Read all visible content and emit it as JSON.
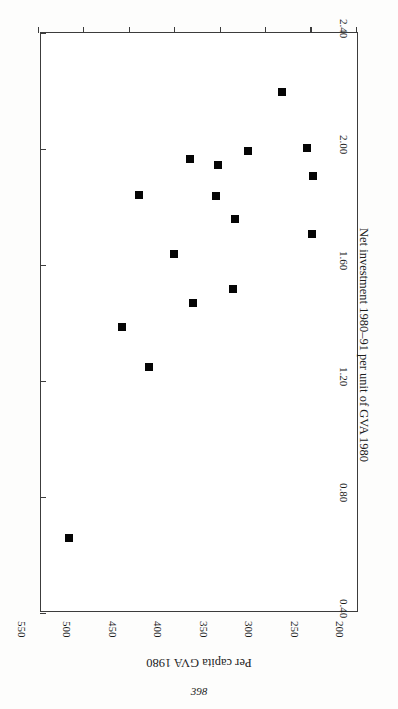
{
  "page": {
    "number": "398"
  },
  "chart_data": {
    "type": "scatter",
    "title": "",
    "subtitle": "",
    "xlabel": "Net investment 1980–91 per unit of GVA 1980",
    "ylabel": "Per capita GVA 1980",
    "xlim": [
      0.4,
      2.4
    ],
    "ylim": [
      200,
      550
    ],
    "xticks": [
      "0.40",
      "0.80",
      "1.20",
      "1.60",
      "2.00",
      "2.40"
    ],
    "xtick_values": [
      0.4,
      0.8,
      1.2,
      1.6,
      2.0,
      2.4
    ],
    "yticks": [
      "200",
      "250",
      "300",
      "350",
      "400",
      "450",
      "500",
      "550"
    ],
    "ytick_values": [
      200,
      250,
      300,
      350,
      400,
      450,
      500,
      550
    ],
    "grid": false,
    "legend": null,
    "legend_position": "none",
    "marker": "filled-square",
    "marker_color": "#050505",
    "frame_color": "#3c3c3c",
    "orientation_note": "figure printed rotated 90 degrees on the scanned page",
    "series": [
      {
        "name": "regions",
        "points": [
          {
            "x": 0.797,
            "y": 495
          },
          {
            "x": 0.893,
            "y": 502
          },
          {
            "x": 0.807,
            "y": 430
          },
          {
            "x": 0.855,
            "y": 397
          },
          {
            "x": 0.834,
            "y": 366
          },
          {
            "x": 0.959,
            "y": 310
          },
          {
            "x": 0.962,
            "y": 395
          },
          {
            "x": 1.041,
            "y": 416
          },
          {
            "x": 1.093,
            "y": 500
          },
          {
            "x": 1.162,
            "y": 349
          },
          {
            "x": 1.283,
            "y": 414
          },
          {
            "x": 1.331,
            "y": 370
          },
          {
            "x": 1.414,
            "y": 291
          },
          {
            "x": 1.552,
            "y": 321
          },
          {
            "x": 2.141,
            "y": 233
          },
          {
            "x": 0.602,
            "y": 467
          }
        ]
      }
    ]
  }
}
